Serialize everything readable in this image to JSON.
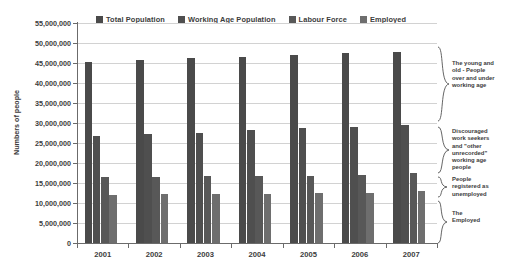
{
  "chart_data": {
    "type": "bar",
    "title": "",
    "xlabel": "",
    "ylabel": "Numbers of people",
    "categories": [
      "2001",
      "2002",
      "2003",
      "2004",
      "2005",
      "2006",
      "2007"
    ],
    "ylim": [
      0,
      55000000
    ],
    "ytick_step": 5000000,
    "ytick_labels": [
      "55,000,000",
      "50,000,000",
      "45,000,000",
      "40,000,000",
      "35,000,000",
      "30,000,000",
      "25,000,000",
      "20,000,000",
      "15,000,000",
      "10,000,000",
      "5,000,000",
      "0"
    ],
    "ytick_values": [
      55000000,
      50000000,
      45000000,
      40000000,
      35000000,
      30000000,
      25000000,
      20000000,
      15000000,
      10000000,
      5000000,
      0
    ],
    "grid": true,
    "legend_position": "top",
    "series": [
      {
        "name": "Total Population",
        "color": "#4a4a4a",
        "values": [
          45200000,
          45800000,
          46200000,
          46500000,
          47000000,
          47400000,
          47800000
        ]
      },
      {
        "name": "Working Age Population",
        "color": "#4f4f4f",
        "values": [
          26700000,
          27200000,
          27600000,
          28200000,
          28700000,
          29000000,
          29500000
        ]
      },
      {
        "name": "Labour Force",
        "color": "#585858",
        "values": [
          16400000,
          16600000,
          16700000,
          16700000,
          16800000,
          16900000,
          17500000
        ]
      },
      {
        "name": "Employed",
        "color": "#6e6e6e",
        "values": [
          12000000,
          12200000,
          12200000,
          12200000,
          12400000,
          12600000,
          13100000
        ]
      }
    ]
  },
  "legend": {
    "items": [
      {
        "label": "Total Population",
        "color": "#4a4a4a"
      },
      {
        "label": "Working Age Population",
        "color": "#4f4f4f"
      },
      {
        "label": "Labour Force",
        "color": "#585858"
      },
      {
        "label": "Employed",
        "color": "#6e6e6e"
      }
    ]
  },
  "annotations": [
    {
      "id": "young-and-old",
      "text": "The young and old - People over and under working age"
    },
    {
      "id": "discouraged-seekers",
      "text": "Discouraged work seekers and \"other unrecorded\" working age people"
    },
    {
      "id": "registered-unemployed",
      "text": "People registered as unemployed"
    },
    {
      "id": "the-employed",
      "text": "The Employed"
    }
  ]
}
